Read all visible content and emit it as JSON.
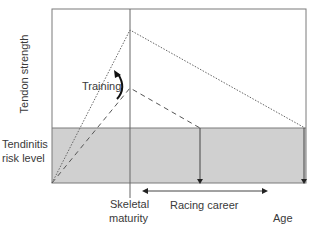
{
  "diagram": {
    "y_axis_label": "Tendon strength",
    "risk_label_line1": "Tendinitis",
    "risk_label_line2": "risk level",
    "training_label": "Training",
    "skeletal_label_line1": "Skeletal",
    "skeletal_label_line2": "maturity",
    "racing_label": "Racing career",
    "x_axis_label": "Age",
    "colors": {
      "frame": "#7a7a7a",
      "risk_band": "#d0d0d0",
      "line": "#555555",
      "arrow": "#222222"
    }
  }
}
